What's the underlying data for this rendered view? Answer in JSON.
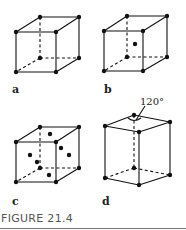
{
  "figure": {
    "caption": "FIGURE 21.4",
    "panels": [
      {
        "id": "a",
        "label": "a",
        "structure": "simple cubic"
      },
      {
        "id": "b",
        "label": "b",
        "structure": "body-centered cubic"
      },
      {
        "id": "c",
        "label": "c",
        "structure": "face-centered cubic"
      },
      {
        "id": "d",
        "label": "d",
        "structure": "hexagonal",
        "annotation": "120°"
      }
    ]
  }
}
